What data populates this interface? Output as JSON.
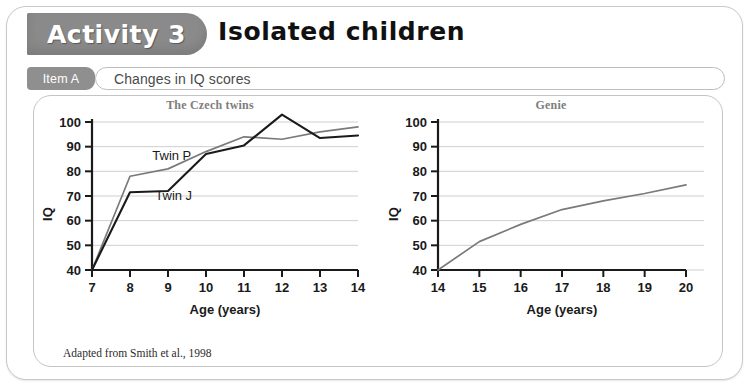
{
  "header": {
    "activity_label": "Activity 3",
    "title": "Isolated children"
  },
  "item": {
    "tab_label": "Item A",
    "caption": "Changes in IQ scores"
  },
  "credit": "Adapted from Smith et al., 1998",
  "colors": {
    "tab_gray": "#8a8a8a",
    "panel_border": "#c4c4c4",
    "gridline": "#cfcfcf",
    "axis": "#1a1a1a",
    "series_twin_j": "#1a1a1a",
    "series_twin_p": "#7a7a7a",
    "series_genie": "#7a7a7a",
    "title_gray": "#7d7d7d"
  },
  "chart_data": [
    {
      "type": "line",
      "title": "The Czech twins",
      "xlabel": "Age (years)",
      "ylabel": "IQ",
      "xlim": [
        7,
        14
      ],
      "ylim": [
        40,
        100
      ],
      "xticks": [
        7,
        8,
        9,
        10,
        11,
        12,
        13,
        14
      ],
      "yticks": [
        40,
        50,
        60,
        70,
        80,
        90,
        100
      ],
      "grid": "horizontal",
      "legend": "inline-labels",
      "x": [
        7,
        8,
        9,
        10,
        11,
        12,
        13,
        14
      ],
      "series": [
        {
          "name": "Twin P",
          "color": "#7a7a7a",
          "label_x": 9.1,
          "label_y": 84.5,
          "values": [
            40,
            78,
            81,
            88,
            94,
            93,
            96,
            98
          ]
        },
        {
          "name": "Twin J",
          "color": "#1a1a1a",
          "label_x": 9.15,
          "label_y": 68.5,
          "values": [
            40,
            71.5,
            72,
            87,
            90.5,
            103,
            93.5,
            94.5
          ]
        }
      ]
    },
    {
      "type": "line",
      "title": "Genie",
      "xlabel": "Age (years)",
      "ylabel": "IQ",
      "xlim": [
        14,
        20
      ],
      "ylim": [
        40,
        100
      ],
      "xticks": [
        14,
        15,
        16,
        17,
        18,
        19,
        20
      ],
      "yticks": [
        40,
        50,
        60,
        70,
        80,
        90,
        100
      ],
      "grid": "horizontal",
      "legend": "none",
      "x": [
        14,
        15,
        16,
        17,
        18,
        19,
        20
      ],
      "series": [
        {
          "name": "Genie",
          "color": "#7a7a7a",
          "values": [
            40,
            51.5,
            58.5,
            64.5,
            68,
            71,
            74.5
          ]
        }
      ]
    }
  ]
}
